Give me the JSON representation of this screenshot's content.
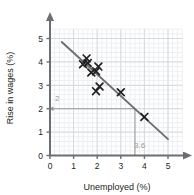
{
  "chart_data": {
    "type": "scatter",
    "title": "",
    "xlabel": "Unemployed (%)",
    "ylabel": "Rise in wages (%)",
    "xlim": [
      0,
      5.6
    ],
    "ylim": [
      0,
      5.4
    ],
    "xticks": [
      "0",
      "1",
      "2",
      "3",
      "4",
      "5"
    ],
    "xtick_values": [
      0,
      1,
      2,
      3,
      4,
      5
    ],
    "yticks": [
      "0",
      "1",
      "2",
      "3",
      "4",
      "5"
    ],
    "ytick_values": [
      0,
      1,
      2,
      3,
      4,
      5
    ],
    "grid": true,
    "grid_minor_step": 0.2,
    "grid_major_step": 1,
    "legend": null,
    "points": [
      {
        "x": 1.4,
        "y": 3.9
      },
      {
        "x": 1.55,
        "y": 4.15
      },
      {
        "x": 1.6,
        "y": 3.95
      },
      {
        "x": 1.75,
        "y": 3.55
      },
      {
        "x": 1.95,
        "y": 3.6
      },
      {
        "x": 2.05,
        "y": 3.8
      },
      {
        "x": 1.95,
        "y": 2.75
      },
      {
        "x": 2.1,
        "y": 2.95
      },
      {
        "x": 3.0,
        "y": 2.7
      },
      {
        "x": 4.0,
        "y": 1.65
      }
    ],
    "marker": "x",
    "marker_color": "#231f20",
    "trend_line": {
      "x_start": 0.5,
      "y_start": 4.85,
      "x_end": 5.0,
      "y_end": 0.7,
      "color": "#6d6e71"
    },
    "annotations": [
      {
        "name": "y-guide",
        "label": "2",
        "type": "horizontal-guide",
        "y": 2,
        "x_from": 3.6,
        "x_to": 0,
        "arrow": "left",
        "color": "#9a9a9a"
      },
      {
        "name": "x-guide",
        "label": "3.6",
        "type": "vertical-guide",
        "x": 3.6,
        "y_from": 2,
        "y_to": 0,
        "arrow": "none",
        "color": "#9a9a9a"
      }
    ]
  },
  "axes": {
    "x_title": "Unemployed (%)",
    "y_title": "Rise in wages (%)",
    "x_tick_labels": [
      "0",
      "1",
      "2",
      "3",
      "4",
      "5"
    ],
    "y_tick_labels": [
      "0",
      "1",
      "2",
      "3",
      "4",
      "5"
    ]
  },
  "annotation_labels": {
    "y_value": "2",
    "x_value": "3.6"
  },
  "colors": {
    "axis": "#6d6e71",
    "marker": "#231f20",
    "trend": "#6d6e71",
    "guide": "#9a9a9a",
    "grid_minor": "#eceff1",
    "grid_major": "#d6dade",
    "text": "#231f20",
    "background": "#ffffff"
  }
}
